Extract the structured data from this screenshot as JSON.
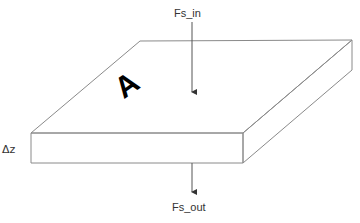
{
  "diagram": {
    "type": "3d-slab-flux-diagram",
    "labels": {
      "flux_in": "Fs_in",
      "flux_out": "Fs_out",
      "thickness": "Δz",
      "area": "A"
    },
    "colors": {
      "edges": "#8a8a8a",
      "arrows": "#555555",
      "text": "#333333",
      "area_label": "#000000",
      "background": "#ffffff"
    },
    "geometry": {
      "front_left_top": [
        31,
        133
      ],
      "front_right_top": [
        243,
        133
      ],
      "back_right_top": [
        352,
        40
      ],
      "back_left_top": [
        140,
        41
      ],
      "front_left_bottom": [
        31,
        163
      ],
      "front_right_bottom": [
        243,
        163
      ],
      "back_right_bottom": [
        352,
        70
      ],
      "arrow_in": {
        "x": 192,
        "y1": 22,
        "y2": 97
      },
      "arrow_out": {
        "x": 192,
        "y1": 163,
        "y2": 197
      }
    }
  }
}
